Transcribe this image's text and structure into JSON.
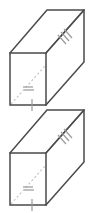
{
  "figure": {
    "shape_count": 2,
    "shape_type": "rectangular prism",
    "projection": "oblique",
    "colors": {
      "background": "#ffffff",
      "visible_edge": "#4a4a4a",
      "hidden_edge": "#b9b9b9",
      "diagonal_dashed": "#c2c2c2",
      "diagonal_solid": "#5a5a5a",
      "tick_mark": "#9a9a9a"
    },
    "solids": [
      {
        "name": "upper-prism",
        "front_face": {
          "x": 10,
          "y": 53,
          "width": 36,
          "height": 52
        },
        "depth_offset": {
          "dx": 37,
          "dy": -43
        },
        "marks": [
          {
            "name": "space-diagonal-solid",
            "ticks": 3
          },
          {
            "name": "face-diagonal-dashed",
            "ticks": 2
          },
          {
            "name": "bottom-edge-midpoint",
            "ticks": 1
          }
        ]
      },
      {
        "name": "lower-prism",
        "front_face": {
          "x": 10,
          "y": 153,
          "width": 36,
          "height": 52
        },
        "depth_offset": {
          "dx": 37,
          "dy": -43
        },
        "marks": [
          {
            "name": "space-diagonal-solid",
            "ticks": 3
          },
          {
            "name": "face-diagonal-dashed",
            "ticks": 2
          },
          {
            "name": "bottom-edge-midpoint",
            "ticks": 1
          }
        ]
      }
    ]
  }
}
